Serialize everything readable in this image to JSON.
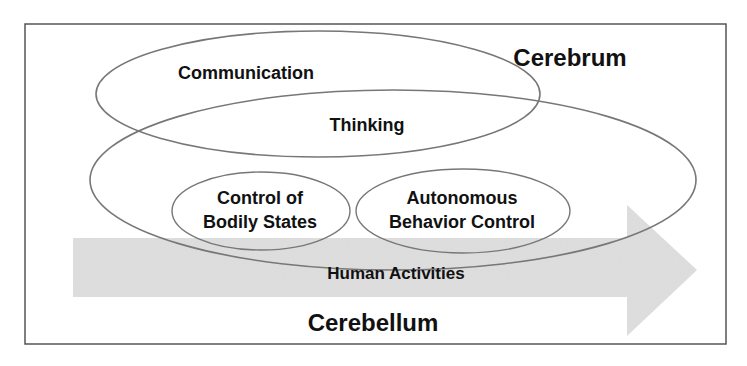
{
  "diagram": {
    "labels": {
      "cerebrum": "Cerebrum",
      "cerebellum": "Cerebellum",
      "communication": "Communication",
      "thinking": "Thinking",
      "control_line1": "Control of",
      "control_line2": "Bodily States",
      "autonomous_line1": "Autonomous",
      "autonomous_line2": "Behavior Control",
      "human_activities": "Human Activities"
    },
    "colors": {
      "frame": "#555555",
      "ellipse_stroke": "#777777",
      "arrow_fill": "#d9d9d9",
      "text": "#111111"
    }
  }
}
